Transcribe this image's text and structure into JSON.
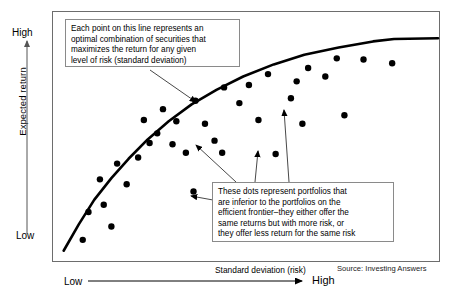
{
  "figure": {
    "title_visible": false,
    "source": "Source: Investing Answers"
  },
  "axes": {
    "y": {
      "label": "Expected return",
      "high_tick": "High",
      "low_tick": "Low",
      "arrow": "up-arrow-icon"
    },
    "x": {
      "label": "Standard deviation (risk)",
      "high_tick": "High",
      "low_tick": "Low",
      "arrow": "right-arrow-icon"
    }
  },
  "callouts": [
    {
      "id": "frontier",
      "lines": [
        "Each point on this line represents an",
        "optimal combination of securities that",
        "maximizes the return for any given",
        "level of risk (standard deviation)"
      ]
    },
    {
      "id": "inferior",
      "lines": [
        "These dots represent portfolios that",
        "are inferior to the portfolios on the",
        "efficient frontier–they either offer the",
        "same returns but with more risk, or",
        "they offer less return for the same risk"
      ]
    }
  ],
  "chart_data": {
    "type": "scatter",
    "title": "",
    "xlabel": "Standard deviation (risk)",
    "ylabel": "Expected return",
    "xlim": [
      0,
      100
    ],
    "ylim": [
      0,
      100
    ],
    "grid": false,
    "legend": "none",
    "series": [
      {
        "name": "Efficient frontier",
        "type": "line",
        "color": "#000000",
        "width": 2.6,
        "points": [
          [
            2.0,
            3.0
          ],
          [
            6.0,
            14.0
          ],
          [
            10.0,
            24.0
          ],
          [
            14.5,
            33.0
          ],
          [
            19.0,
            41.0
          ],
          [
            24.0,
            49.0
          ],
          [
            29.5,
            56.5
          ],
          [
            35.5,
            63.5
          ],
          [
            42.0,
            69.5
          ],
          [
            49.0,
            75.0
          ],
          [
            57.0,
            80.0
          ],
          [
            65.0,
            84.0
          ],
          [
            74.0,
            87.0
          ],
          [
            83.0,
            89.5
          ],
          [
            88.5,
            90.5
          ],
          [
            100.0,
            90.8
          ]
        ]
      },
      {
        "name": "Inferior portfolios",
        "type": "scatter",
        "color": "#000000",
        "marker": "filled-circle",
        "marker_size": 6.4,
        "points": [
          [
            7.0,
            7.5
          ],
          [
            8.5,
            19.0
          ],
          [
            12.5,
            22.0
          ],
          [
            14.5,
            13.0
          ],
          [
            11.5,
            32.5
          ],
          [
            16.0,
            39.0
          ],
          [
            18.5,
            30.5
          ],
          [
            21.5,
            41.5
          ],
          [
            24.5,
            47.5
          ],
          [
            23.0,
            57.0
          ],
          [
            26.5,
            51.5
          ],
          [
            28.0,
            61.5
          ],
          [
            31.5,
            56.5
          ],
          [
            30.5,
            47.0
          ],
          [
            34.0,
            43.5
          ],
          [
            36.5,
            65.0
          ],
          [
            39.0,
            55.5
          ],
          [
            36.0,
            27.5
          ],
          [
            41.5,
            48.5
          ],
          [
            44.0,
            70.5
          ],
          [
            43.5,
            43.5
          ],
          [
            48.0,
            64.0
          ],
          [
            50.5,
            71.5
          ],
          [
            53.0,
            57.0
          ],
          [
            55.5,
            76.0
          ],
          [
            57.5,
            43.0
          ],
          [
            56.5,
            27.0
          ],
          [
            61.5,
            66.0
          ],
          [
            63.0,
            73.0
          ],
          [
            66.0,
            78.5
          ],
          [
            64.5,
            55.5
          ],
          [
            70.5,
            75.0
          ],
          [
            73.5,
            82.5
          ],
          [
            80.5,
            82.0
          ],
          [
            88.0,
            80.5
          ],
          [
            75.5,
            59.0
          ]
        ]
      }
    ]
  },
  "leaders": [
    {
      "name": "frontier-leader",
      "from": [
        150,
        70
      ],
      "to": [
        196,
        102
      ]
    },
    {
      "name": "inferior-leader-left",
      "from": [
        213,
        200
      ],
      "to": [
        191,
        196
      ]
    },
    {
      "name": "inferior-leader-mid",
      "from": [
        255,
        182
      ],
      "to": [
        258,
        151
      ]
    },
    {
      "name": "inferior-leader-right",
      "from": [
        289,
        182
      ],
      "to": [
        284,
        110
      ]
    },
    {
      "name": "inferior-leader-far",
      "from": [
        236,
        182
      ],
      "to": [
        196,
        145
      ]
    }
  ]
}
